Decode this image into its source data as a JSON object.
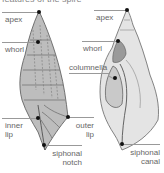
{
  "caption": "features of the spire",
  "left_shell": {
    "view": "exterior",
    "labels": {
      "apex": "apex",
      "whorl": "whorl",
      "inner_lip": "inner\nlip",
      "outer_lip": "outer\nlip",
      "siphonal_notch": "siphonal\nnotch"
    }
  },
  "right_shell": {
    "view": "cross-section",
    "labels": {
      "apex": "apex",
      "whorl": "whorl",
      "columnella": "columnella",
      "siphonal_canal": "siphonal\ncanal"
    }
  },
  "colors": {
    "background": "#ffffff",
    "label_text": "#666666",
    "leader_line": "#999999",
    "marker_dot": "#111111",
    "shell_shading": "#8a8a8a"
  }
}
